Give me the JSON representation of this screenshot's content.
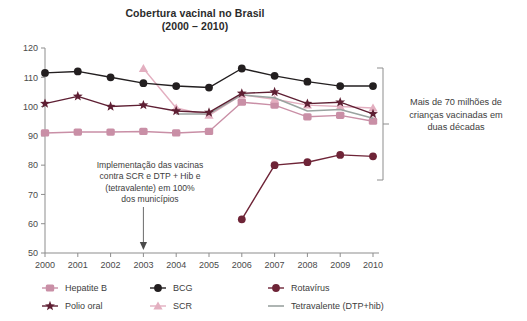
{
  "title": {
    "line1": "Cobertura vacinal no Brasil",
    "line2": "(2000 – 2010)"
  },
  "annotation": {
    "line1": "Implementação das vacinas",
    "line2": "contra SCR e DTP + Hib e",
    "line3": "(tetravalente) em 100%",
    "line4": "dos municípios",
    "arrow_icon": "down-arrow-icon",
    "points_at_year": "2003"
  },
  "right_note": {
    "line1": "Mais de 70 milhões de",
    "line2": "crianças vacinadas em",
    "line3": "duas décadas",
    "bracket_icon": "vertical-bracket-icon"
  },
  "legend": [
    {
      "label": "Hepatite B",
      "color": "#c98fa6",
      "marker": "square"
    },
    {
      "label": "BCG",
      "color": "#231f20",
      "marker": "circle"
    },
    {
      "label": "Rotavírus",
      "color": "#6e2437",
      "marker": "circle"
    },
    {
      "label": "Polio oral",
      "color": "#5e1f33",
      "marker": "star"
    },
    {
      "label": "SCR",
      "color": "#e3afc0",
      "marker": "triangle"
    },
    {
      "label": "Tetravalente (DTP+hib)",
      "color": "#9aa3a0",
      "marker": "line"
    }
  ],
  "chart_data": {
    "type": "line",
    "title": "Cobertura vacinal no Brasil (2000 – 2010)",
    "xlabel": "",
    "ylabel": "",
    "x": [
      2000,
      2001,
      2002,
      2003,
      2004,
      2005,
      2006,
      2007,
      2008,
      2009,
      2010
    ],
    "categories": [
      "2000",
      "2001",
      "2002",
      "2003",
      "2004",
      "2005",
      "2006",
      "2007",
      "2008",
      "2009",
      "2010"
    ],
    "ylim": [
      50,
      120
    ],
    "yticks": [
      50,
      60,
      70,
      80,
      90,
      100,
      110,
      120
    ],
    "grid": false,
    "legend_position": "bottom",
    "series": [
      {
        "name": "Hepatite B",
        "color": "#c98fa6",
        "marker": "square",
        "x": [
          2000,
          2001,
          2002,
          2003,
          2004,
          2005,
          2006,
          2007,
          2008,
          2009,
          2010
        ],
        "values": [
          91.0,
          91.3,
          91.3,
          91.5,
          91.0,
          91.5,
          101.5,
          100.5,
          96.5,
          97.0,
          95.0
        ]
      },
      {
        "name": "BCG",
        "color": "#231f20",
        "marker": "circle",
        "x": [
          2000,
          2001,
          2002,
          2003,
          2004,
          2005,
          2006,
          2007,
          2008,
          2009,
          2010
        ],
        "values": [
          111.5,
          112.0,
          110.0,
          108.0,
          107.0,
          106.5,
          113.0,
          110.5,
          108.5,
          107.0,
          107.0
        ]
      },
      {
        "name": "Rotavírus",
        "color": "#6e2437",
        "marker": "circle",
        "x": [
          2006,
          2007,
          2008,
          2009,
          2010
        ],
        "values": [
          61.5,
          80.0,
          81.0,
          83.5,
          83.0
        ]
      },
      {
        "name": "Polio oral",
        "color": "#5e1f33",
        "marker": "star",
        "x": [
          2000,
          2001,
          2002,
          2003,
          2004,
          2005,
          2006,
          2007,
          2008,
          2009,
          2010
        ],
        "values": [
          101.0,
          103.5,
          100.0,
          100.5,
          98.5,
          98.0,
          104.5,
          105.0,
          101.0,
          101.5,
          97.5
        ]
      },
      {
        "name": "SCR",
        "color": "#e3afc0",
        "marker": "triangle",
        "x": [
          2003,
          2004,
          2005,
          2006,
          2007,
          2008,
          2009,
          2010
        ],
        "values": [
          113.0,
          99.5,
          97.0,
          104.0,
          102.5,
          100.5,
          100.0,
          99.5
        ]
      },
      {
        "name": "Tetravalente (DTP+hib)",
        "color": "#9aa3a0",
        "marker": "line",
        "x": [
          2004,
          2005,
          2006,
          2007,
          2008,
          2009,
          2010
        ],
        "values": [
          97.5,
          97.5,
          104.0,
          103.0,
          98.5,
          99.0,
          96.0
        ]
      }
    ]
  }
}
